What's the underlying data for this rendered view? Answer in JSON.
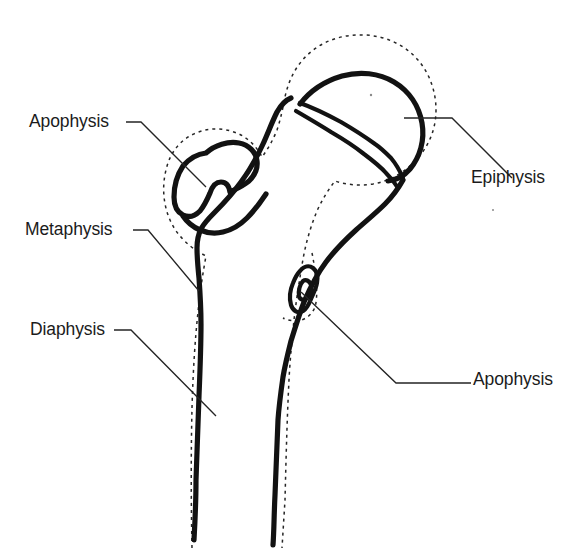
{
  "figure": {
    "background_color": "#ffffff",
    "line_color": "#121212",
    "dotted_outline_color": "#262626",
    "leader_color": "#242424",
    "label_color": "#1b1b1b"
  },
  "labels": {
    "apophysis_greater_trochanter": "Apophysis",
    "metaphysis": "Metaphysis",
    "diaphysis": "Diaphysis",
    "epiphysis": "Epiphysis",
    "apophysis_lesser_trochanter": "Apophysis"
  },
  "structures": [
    {
      "name": "femoral-head-epiphysis",
      "label": "Epiphysis"
    },
    {
      "name": "greater-trochanter-apophysis",
      "label": "Apophysis"
    },
    {
      "name": "lesser-trochanter-apophysis",
      "label": "Apophysis"
    },
    {
      "name": "metaphysis-region",
      "label": "Metaphysis"
    },
    {
      "name": "diaphysis-shaft",
      "label": "Diaphysis"
    },
    {
      "name": "physis-growth-plate",
      "label": ""
    },
    {
      "name": "cartilage-periosteum-outline",
      "label": ""
    }
  ]
}
